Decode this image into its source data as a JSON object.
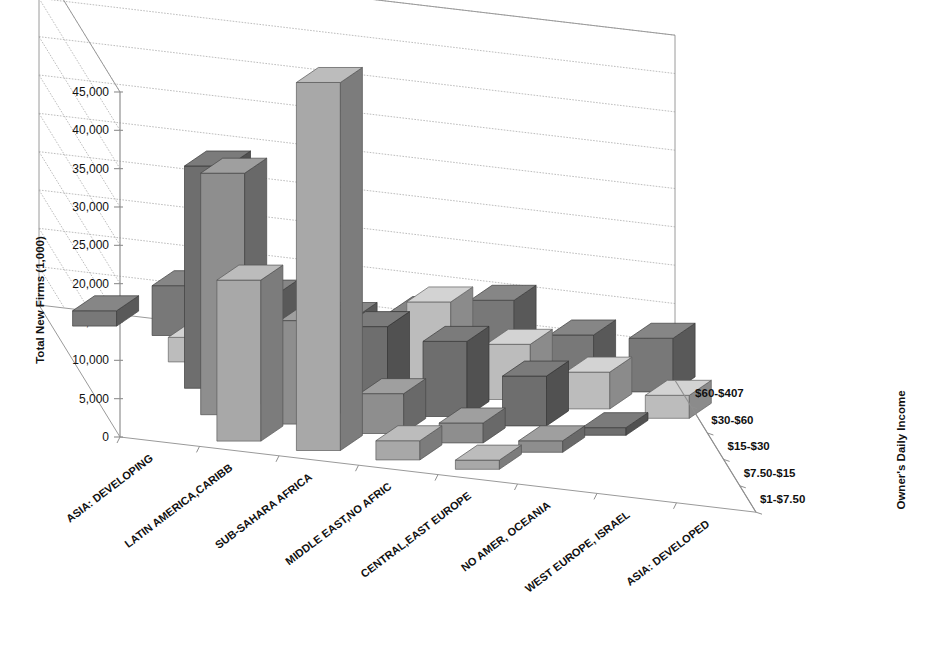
{
  "chart_data": {
    "type": "bar",
    "subtype": "3d-grouped-bar",
    "title": "",
    "xlabel": "",
    "ylabel": "Total New Firms (1,000)",
    "zlabel": "Owner's Daily Income",
    "ylim": [
      0,
      45000
    ],
    "ytick_step": 5000,
    "ytick_labels": [
      "0",
      "5,000",
      "10,000",
      "15,000",
      "20,000",
      "25,000",
      "30,000",
      "35,000",
      "40,000",
      "45,000"
    ],
    "ytick_values": [
      0,
      5000,
      10000,
      15000,
      20000,
      25000,
      30000,
      35000,
      40000,
      45000
    ],
    "grid": true,
    "legend_position": "depth-axis-right",
    "categories": [
      "ASIA: DEVELOPING",
      "LATIN AMERICA,CARIBB",
      "SUB-SAHARA AFRICA",
      "MIDDLE EAST,NO AFRIC",
      "CENTRAL,EAST EUROPE",
      "NO AMER, OCEANIA",
      "WEST EUROPE, ISRAEL",
      "ASIA: DEVELOPED"
    ],
    "series": [
      {
        "name": "$1-$7.50",
        "color": "#a8a8a8",
        "values": [
          0,
          21000,
          48000,
          2500,
          1200,
          0,
          0,
          0
        ]
      },
      {
        "name": "$7.50-$15",
        "color": "#8e8e8e",
        "values": [
          0,
          31500,
          13500,
          5200,
          2600,
          1500,
          0,
          0
        ]
      },
      {
        "name": "$15-$30",
        "color": "#6e6e6e",
        "values": [
          0,
          29000,
          8000,
          10500,
          9800,
          6500,
          1000,
          0
        ]
      },
      {
        "name": "$30-$60",
        "color": "#bcbcbc",
        "values": [
          0,
          3200,
          4200,
          5800,
          11500,
          7200,
          4800,
          3000
        ]
      },
      {
        "name": "$60-$407",
        "color": "#787878",
        "values": [
          2000,
          6500,
          6500,
          4800,
          6800,
          9500,
          6200,
          7000
        ]
      }
    ]
  },
  "geometry": {
    "origin_x": 120,
    "origin_y": 437,
    "y_px_per_unit": 0.007667,
    "cat_step_x": 79.5,
    "cat_step_y": 9.4,
    "depth_step_x": -16.2,
    "depth_step_y": -26.4,
    "bar_w": 44,
    "bar_dx": 22,
    "bar_dy": -15
  }
}
